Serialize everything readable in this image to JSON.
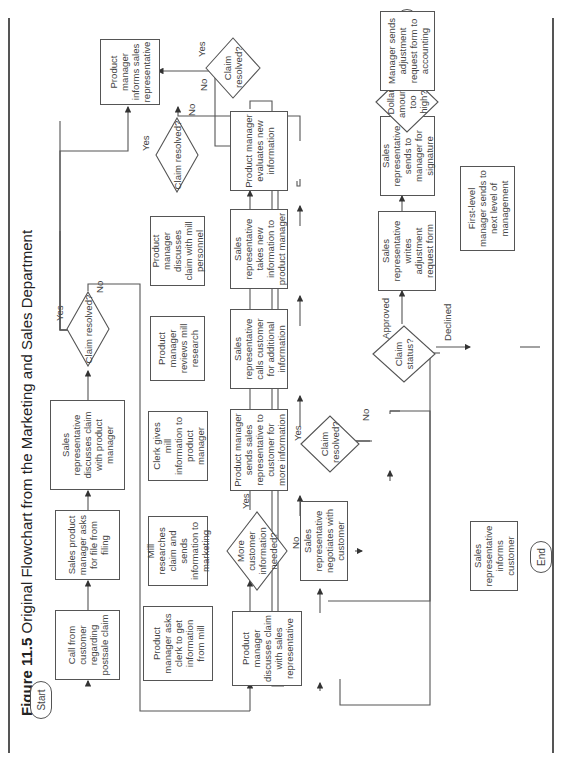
{
  "figure": {
    "number": "Figure 11.5",
    "title": "Original Flowchart from the Marketing and Sales Department"
  },
  "terminals": {
    "start": "Start",
    "end_top": "End",
    "end_bottom": "End"
  },
  "processes": {
    "call_from_customer": "Call from customer regarding postsale claim",
    "sales_pm_asks_file": "Sales product manager asks for file from filing",
    "rep_discusses_with_pm": "Sales representative discusses claim with product manager",
    "pm_informs_rep": "Product manager informs sales representative",
    "pm_asks_clerk": "Product manager asks clerk to get information from mill",
    "mill_researches": "Mill researches claim and sends information to marketing",
    "clerk_gives_info": "Clerk gives mill information to product manager",
    "pm_reviews_research": "Product manager reviews mill research",
    "pm_discusses_mill": "Product manager discusses claim with mill personnel",
    "pm_discusses_rep": "Product manager discusses claim with sales representative",
    "pm_sends_rep": "Product manager sends sales representative to customer for more information",
    "rep_calls_customer": "Sales representative calls customer for additional information",
    "rep_takes_info": "Sales representative takes new information to product manager",
    "pm_evaluates": "Product manager evaluates new information",
    "rep_negotiates": "Sales representative negotiates with customer",
    "rep_writes_form": "Sales representative writes adjustment request form",
    "rep_sends_manager": "Sales representative sends to manager for signature",
    "manager_sends_accounting": "Manager sends adjustment request form to accounting",
    "first_level_manager": "First-level manager sends to next level of management",
    "rep_informs_customer": "Sales representative informs customer"
  },
  "decisions": {
    "claim_resolved_1": "Claim resolved?",
    "claim_resolved_2": "Claim resolved?",
    "claim_resolved_3": "Claim resolved?",
    "claim_resolved_4": "Claim resolved?",
    "more_info_needed": "More customer information needed?",
    "claim_status": "Claim status?",
    "dollar_too_high": "Dollar amount too high?"
  },
  "edge_labels": {
    "yes": "Yes",
    "no": "No",
    "approved": "Approved",
    "declined": "Declined"
  }
}
